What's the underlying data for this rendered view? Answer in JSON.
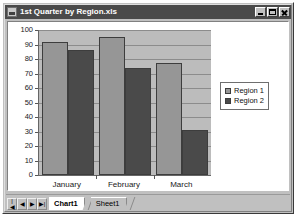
{
  "window": {
    "title": "1st Quarter by Region.xls",
    "app_icon": "spreadsheet-icon",
    "buttons": {
      "minimize": "Minimize",
      "maximize": "Maximize",
      "close": "Close"
    }
  },
  "chart_data": {
    "type": "bar",
    "title": "",
    "xlabel": "",
    "ylabel": "",
    "categories": [
      "January",
      "February",
      "March"
    ],
    "series": [
      {
        "name": "Region 1",
        "color": "#969696",
        "values": [
          92,
          95,
          77
        ]
      },
      {
        "name": "Region 2",
        "color": "#4a4a4a",
        "values": [
          86,
          74,
          31
        ]
      }
    ],
    "ylim": [
      0,
      100
    ],
    "ytick_step": 10,
    "yticks": [
      100,
      90,
      80,
      70,
      60,
      50,
      40,
      30,
      20,
      10,
      0
    ],
    "grid": true,
    "legend_position": "right",
    "plot_background": "#bcbcbc"
  },
  "sheet_bar": {
    "nav": [
      {
        "name": "first",
        "glyph": "|◀"
      },
      {
        "name": "previous",
        "glyph": "◀"
      },
      {
        "name": "next",
        "glyph": "▶"
      },
      {
        "name": "last",
        "glyph": "▶|"
      }
    ],
    "tabs": [
      {
        "label": "Chart1",
        "active": true
      },
      {
        "label": "Sheet1",
        "active": false
      }
    ]
  }
}
